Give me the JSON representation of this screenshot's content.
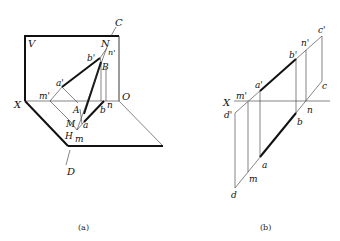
{
  "figure_a": {
    "caption": "(a)",
    "labels": {
      "V": "V",
      "X": "X",
      "O": "O",
      "H": "H",
      "C": "C",
      "D": "D",
      "N": "N",
      "B": "B",
      "A": "A",
      "M": "M",
      "b_prime": "b'",
      "n_prime": "n'",
      "a_prime": "a'",
      "m_prime": "m'",
      "a": "a",
      "b": "b",
      "n": "n",
      "m": "m"
    }
  },
  "figure_b": {
    "caption": "(b)",
    "labels": {
      "X": "X",
      "c_prime": "c'",
      "n_prime": "n'",
      "b_prime": "b'",
      "a_prime": "a'",
      "m_prime": "m'",
      "d_prime": "d'",
      "c": "c",
      "n": "n",
      "b": "b",
      "a": "a",
      "m": "m",
      "d": "d"
    }
  },
  "colors": {
    "line": "#111111",
    "background": "#ffffff"
  }
}
